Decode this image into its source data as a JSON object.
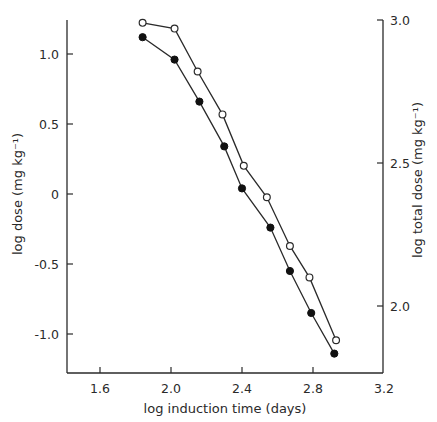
{
  "chart_data": {
    "type": "line",
    "title": "",
    "xlabel": "log induction time (days)",
    "ylabel": "log dose (mg kg⁻¹)",
    "ylabel_right": "log total dose (mg kg⁻¹)",
    "xlim": [
      1.4,
      3.2
    ],
    "ylim": [
      -1.25,
      1.25
    ],
    "ylim_right": [
      1.81,
      3.0
    ],
    "x_ticks": [
      "1.6",
      "2.0",
      "2.4",
      "2.8",
      "3.2"
    ],
    "y_ticks": [
      "1.0",
      "0.5",
      "0",
      "-0.5",
      "-1.0"
    ],
    "y_ticks_right": [
      "3.0",
      "2.5",
      "2.0"
    ],
    "grid": false,
    "legend": "none",
    "series": [
      {
        "name": "log dose",
        "axis": "left",
        "marker": "filled-circle",
        "x": [
          1.84,
          2.02,
          2.16,
          2.3,
          2.4,
          2.56,
          2.67,
          2.79,
          2.92
        ],
        "y": [
          1.12,
          0.96,
          0.66,
          0.34,
          0.04,
          -0.24,
          -0.55,
          -0.85,
          -1.14
        ]
      },
      {
        "name": "log total dose",
        "axis": "right",
        "marker": "open-circle",
        "x": [
          1.84,
          2.02,
          2.15,
          2.29,
          2.41,
          2.54,
          2.67,
          2.78,
          2.93
        ],
        "y": [
          2.99,
          2.97,
          2.82,
          2.67,
          2.49,
          2.38,
          2.21,
          2.1,
          1.88
        ]
      }
    ]
  }
}
